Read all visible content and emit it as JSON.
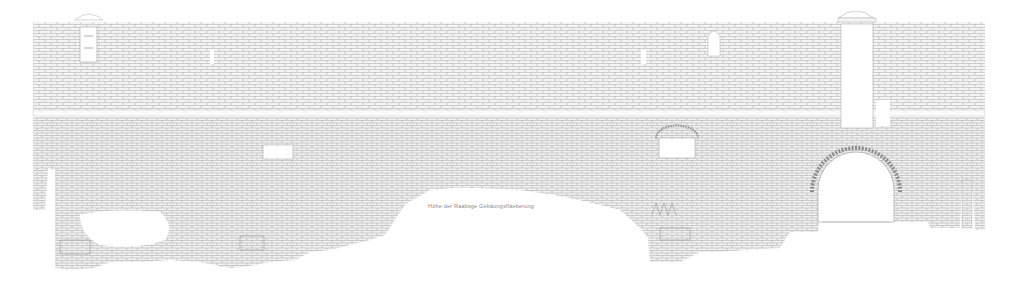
{
  "drawing": {
    "type": "architectural-elevation",
    "subject": "masonry wall elevation with tower",
    "background": "#ffffff",
    "line_color": "#9a9a9a",
    "annotation": {
      "text": "Höhe der Raabsge  Gebäungsfläeberung",
      "x": 428,
      "y": 206
    },
    "elements": {
      "string_course_y": 112,
      "wall_top_y": 22,
      "tower": {
        "x": 838,
        "y": 18,
        "width": 38,
        "height": 110
      },
      "arch_opening": {
        "cx": 856,
        "cy": 195,
        "r": 38
      },
      "windows": [
        {
          "x": 80,
          "y": 27,
          "w": 17,
          "h": 35,
          "label": "left-upper-window"
        },
        {
          "x": 210,
          "y": 50,
          "w": 4,
          "h": 14,
          "label": "left-slot-window"
        },
        {
          "x": 641,
          "y": 50,
          "w": 5,
          "h": 14,
          "label": "center-slot-window"
        },
        {
          "x": 708,
          "y": 28,
          "w": 12,
          "h": 28,
          "label": "arched-window"
        },
        {
          "x": 263,
          "y": 145,
          "w": 30,
          "h": 14,
          "label": "lower-left-opening"
        },
        {
          "x": 659,
          "y": 138,
          "w": 36,
          "h": 20,
          "label": "lower-right-opening"
        }
      ]
    }
  }
}
